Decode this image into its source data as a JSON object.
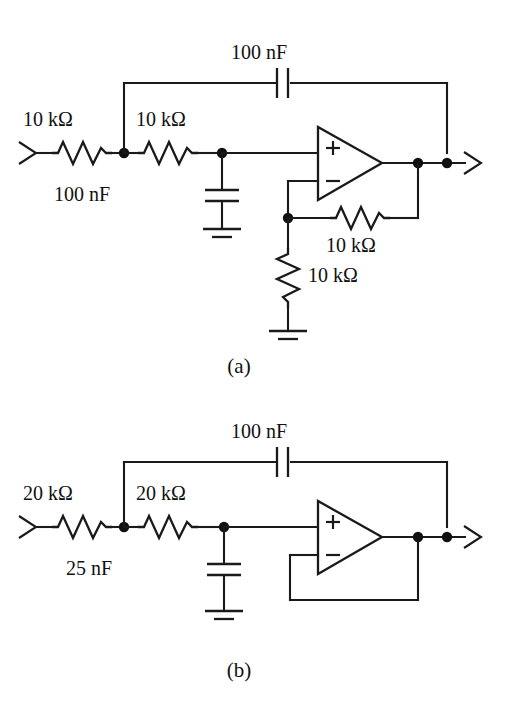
{
  "figure": {
    "background_color": "#ffffff",
    "line_color": "#1a1a1a"
  },
  "circuits": [
    {
      "id": "circuit-a",
      "caption": "(a)",
      "topology": "Sallen-Key low-pass filter with non-inverting gain stage",
      "components": {
        "input_resistor_1": "10 kΩ",
        "input_resistor_2": "10 kΩ",
        "feedback_capacitor": "100 nF",
        "shunt_capacitor": "100 nF",
        "gain_feedback_resistor": "10 kΩ",
        "gain_ground_resistor": "10 kΩ"
      },
      "opamp": {
        "plus_label": "+",
        "minus_label": "−"
      }
    },
    {
      "id": "circuit-b",
      "caption": "(b)",
      "topology": "Sallen-Key low-pass filter with unity-gain buffer",
      "components": {
        "input_resistor_1": "20 kΩ",
        "input_resistor_2": "20 kΩ",
        "feedback_capacitor": "100 nF",
        "shunt_capacitor": "25 nF"
      },
      "opamp": {
        "plus_label": "+",
        "minus_label": "−"
      }
    }
  ],
  "labels": {
    "a_r1": "10 kΩ",
    "a_r2": "10 kΩ",
    "a_cf": "100 nF",
    "a_cs": "100 nF",
    "a_rf": "10 kΩ",
    "a_rg": "10 kΩ",
    "a_caption": "(a)",
    "b_r1": "20 kΩ",
    "b_r2": "20 kΩ",
    "b_cf": "100 nF",
    "b_cs": "25 nF",
    "b_caption": "(b)",
    "opamp_plus": "+",
    "opamp_minus": "−"
  }
}
